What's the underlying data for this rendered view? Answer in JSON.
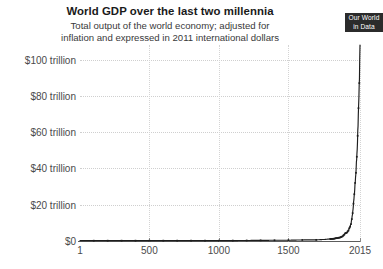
{
  "header": {
    "title": "World GDP over the last two millennia",
    "subtitle_line_1": "Total output of the world economy; adjusted for",
    "subtitle_line_2": "inflation and expressed in 2011 international dollars"
  },
  "logo": {
    "line_1": "Our World",
    "line_2": "in Data",
    "background_color": "#2b2b2b",
    "text_color": "#ffffff"
  },
  "colors": {
    "series_line": "#1d1d1d",
    "gridline": "#cfcfcf",
    "axis": "#5c5c5c",
    "label_text": "#4a4a4b",
    "title_text": "#1a1a1a",
    "background": "#ffffff"
  },
  "axes": {
    "y_tick_labels": [
      "$0",
      "$20 trillion",
      "$40 trillion",
      "$60 trillion",
      "$80 trillion",
      "$100 trillion"
    ],
    "y_tick_values": [
      0,
      20,
      40,
      60,
      80,
      100
    ],
    "x_tick_labels": [
      "1",
      "500",
      "1000",
      "1500",
      "2015"
    ],
    "x_tick_values": [
      1,
      500,
      1000,
      1500,
      2015
    ]
  },
  "chart_data": {
    "type": "line",
    "title": "World GDP over the last two millennia",
    "subtitle": "Total output of the world economy; adjusted for inflation and expressed in 2011 international dollars",
    "xlabel": "",
    "ylabel": "",
    "unit": "trillion 2011 international dollars",
    "xlim": [
      1,
      2015
    ],
    "ylim": [
      0,
      108
    ],
    "grid": true,
    "legend": false,
    "marker": "small-square",
    "x": [
      1,
      500,
      1000,
      1500,
      1600,
      1700,
      1750,
      1800,
      1820,
      1850,
      1870,
      1880,
      1890,
      1900,
      1910,
      1920,
      1930,
      1940,
      1950,
      1955,
      1960,
      1965,
      1970,
      1975,
      1980,
      1985,
      1990,
      1995,
      2000,
      2005,
      2010,
      2015
    ],
    "values": [
      0.18,
      0.2,
      0.21,
      0.43,
      0.58,
      0.64,
      0.81,
      1.1,
      1.2,
      1.6,
      1.9,
      2.2,
      2.6,
      3.4,
      4.3,
      4.6,
      5.6,
      7.2,
      9.3,
      11.8,
      14.2,
      17.5,
      22.2,
      26.2,
      32.0,
      36.8,
      44.2,
      50.5,
      62.0,
      74.5,
      87.0,
      108.0
    ],
    "series": [
      {
        "name": "World GDP",
        "values": [
          0.18,
          0.2,
          0.21,
          0.43,
          0.58,
          0.64,
          0.81,
          1.1,
          1.2,
          1.6,
          1.9,
          2.2,
          2.6,
          3.4,
          4.3,
          4.6,
          5.6,
          7.2,
          9.3,
          11.8,
          14.2,
          17.5,
          22.2,
          26.2,
          32.0,
          36.8,
          44.2,
          50.5,
          62.0,
          74.5,
          87.0,
          108.0
        ]
      }
    ]
  }
}
